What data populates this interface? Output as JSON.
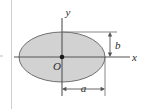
{
  "figure": {
    "type": "geometry-diagram",
    "background_color": "#ffffff",
    "labels": {
      "x_axis": "x",
      "y_axis": "y",
      "origin": "O",
      "semi_major": "a",
      "semi_minor": "b"
    },
    "colors": {
      "shape_fill": "#d2d2d2",
      "shape_stroke": "#6e6e6e",
      "axis_stroke": "#555555",
      "dimension_stroke": "#555555",
      "page_rule": "#c8c8c8",
      "text": "#2b2b2b"
    },
    "geometry": {
      "center_x": 62,
      "center_y": 57,
      "semi_axis_a_px": 43,
      "semi_axis_b_px": 25,
      "x_axis_y": 57,
      "y_axis_x": 62,
      "x_axis_start": 14,
      "x_axis_end": 130,
      "y_axis_top": 18,
      "y_axis_bottom": 96,
      "b_dimension_line_x": 110,
      "b_dimension_top_y": 32,
      "b_dimension_bottom_y": 57,
      "a_dimension_line_y": 89,
      "a_dimension_left_x": 62,
      "a_dimension_right_x": 105,
      "top_extension_line_y": 32,
      "right_extension_line_x": 105
    }
  }
}
